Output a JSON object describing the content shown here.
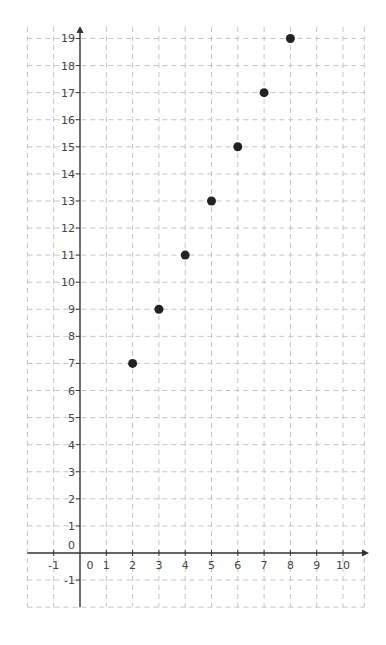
{
  "chart_data": {
    "type": "scatter",
    "title": "",
    "xlabel": "",
    "ylabel": "",
    "xlim": [
      -2,
      11
    ],
    "ylim": [
      -2,
      19.5
    ],
    "grid": true,
    "grid_style": "dashed",
    "legend": null,
    "x_ticks": [
      -1,
      0,
      1,
      2,
      3,
      4,
      5,
      6,
      7,
      8,
      9,
      10
    ],
    "y_ticks": [
      -1,
      0,
      1,
      2,
      3,
      4,
      5,
      6,
      7,
      8,
      9,
      10,
      11,
      12,
      13,
      14,
      15,
      16,
      17,
      18,
      19
    ],
    "series": [
      {
        "name": "points",
        "color": "#222222",
        "x": [
          2,
          3,
          4,
          5,
          6,
          7,
          8
        ],
        "y": [
          7,
          9,
          11,
          13,
          15,
          17,
          19
        ]
      }
    ]
  },
  "colors": {
    "axis": "#333333",
    "grid": "#c4c4c4",
    "point": "#222222",
    "label": "#444444"
  }
}
